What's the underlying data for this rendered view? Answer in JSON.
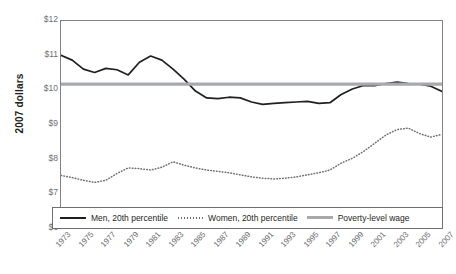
{
  "chart_data": {
    "type": "line",
    "title": "",
    "xlabel": "",
    "ylabel": "2007 dollars",
    "ylim": [
      6,
      12
    ],
    "xlim": [
      1973,
      2007
    ],
    "grid": false,
    "legend_position": "bottom",
    "y_ticks": [
      "$12",
      "$11",
      "$10",
      "$9",
      "$8",
      "$7",
      "$6"
    ],
    "y_tick_values": [
      12,
      11,
      10,
      9,
      8,
      7,
      6
    ],
    "x": [
      1973,
      1974,
      1975,
      1976,
      1977,
      1978,
      1979,
      1980,
      1981,
      1982,
      1983,
      1984,
      1985,
      1986,
      1987,
      1988,
      1989,
      1990,
      1991,
      1992,
      1993,
      1994,
      1995,
      1996,
      1997,
      1998,
      1999,
      2000,
      2001,
      2002,
      2003,
      2004,
      2005,
      2006,
      2007
    ],
    "x_tick_labels": [
      "1973",
      "1975",
      "1977",
      "1979",
      "1981",
      "1983",
      "1985",
      "1987",
      "1989",
      "1991",
      "1993",
      "1995",
      "1997",
      "1999",
      "2001",
      "2003",
      "2005",
      "2007"
    ],
    "series": [
      {
        "name": "Men, 20th percentile",
        "style": "solid",
        "color": "#231f20",
        "values": [
          11.0,
          10.86,
          10.6,
          10.5,
          10.62,
          10.58,
          10.43,
          10.8,
          10.98,
          10.86,
          10.6,
          10.3,
          9.96,
          9.76,
          9.74,
          9.78,
          9.76,
          9.64,
          9.57,
          9.6,
          9.62,
          9.64,
          9.66,
          9.6,
          9.62,
          9.86,
          10.02,
          10.12,
          10.12,
          10.18,
          10.22,
          10.18,
          10.16,
          10.1,
          9.95
        ]
      },
      {
        "name": "Women, 20th percentile",
        "style": "dotted",
        "color": "#6d6e71",
        "values": [
          7.5,
          7.44,
          7.36,
          7.3,
          7.36,
          7.56,
          7.72,
          7.7,
          7.66,
          7.74,
          7.9,
          7.8,
          7.72,
          7.66,
          7.62,
          7.58,
          7.52,
          7.46,
          7.42,
          7.4,
          7.42,
          7.46,
          7.52,
          7.58,
          7.66,
          7.86,
          8.0,
          8.2,
          8.44,
          8.68,
          8.84,
          8.88,
          8.72,
          8.62,
          8.7
        ]
      },
      {
        "name": "Poverty-level wage",
        "style": "thick",
        "color": "#a7a9ac",
        "constant": 10.16
      }
    ],
    "legend": [
      {
        "label": "Men, 20th percentile",
        "style": "solid"
      },
      {
        "label": "Women, 20th percentile",
        "style": "dotted"
      },
      {
        "label": "Poverty-level wage",
        "style": "thick"
      }
    ]
  }
}
